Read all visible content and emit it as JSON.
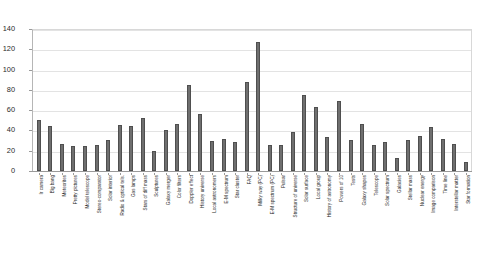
{
  "chart_data": {
    "type": "bar",
    "title": "",
    "xlabel": "",
    "ylabel": "",
    "ylim": [
      0,
      140
    ],
    "yticks": [
      0,
      20,
      40,
      60,
      80,
      100,
      120,
      140
    ],
    "grid": true,
    "legend": false,
    "bar_color": "#6f6f6f",
    "categories": [
      "Ir camera",
      "Big bang",
      "Meteorites",
      "Pretty pictures",
      "Model telescope",
      "Stereo-comparator",
      "Solar interior",
      "Radio & optical tels.",
      "Gas lamps",
      "Stars of diff mass",
      "Sculptures",
      "Galaxy merger",
      "Color filters",
      "Doppler effect",
      "History universe",
      "Local astronomers",
      "E-M spectrum",
      "Star cluster",
      "FAQ",
      "Milky way (PC)",
      "E-M spectrum (PC)",
      "Pulsar",
      "Structure of universe",
      "Solar surface",
      "Local group",
      "History of astronomy",
      "Powers of 10",
      "Tests",
      "Galaxy shapes",
      "Telescope",
      "Solar spectrum",
      "Galaxies",
      "Stellar mass",
      "Nuclear energy",
      "Image comparison",
      "Time line",
      "Interstellar matter",
      "Star formation"
    ],
    "values": [
      50,
      44,
      27,
      25,
      25,
      26,
      31,
      45,
      44,
      52,
      20,
      40,
      46,
      85,
      56,
      30,
      32,
      29,
      88,
      127,
      26,
      26,
      38,
      75,
      63,
      34,
      69,
      31,
      46,
      26,
      29,
      13,
      31,
      35,
      43,
      32,
      27,
      9
    ]
  },
  "axes": {
    "y_tick_labels": [
      "140",
      "120",
      "100",
      "80",
      "60",
      "40",
      "20",
      "0"
    ]
  }
}
